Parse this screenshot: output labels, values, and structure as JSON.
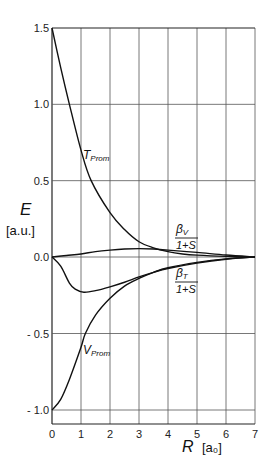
{
  "chart_data": {
    "type": "line",
    "title": "",
    "xlabel": "R [a₀]",
    "ylabel": "E [a.u.]",
    "xlim": [
      0,
      7
    ],
    "ylim": [
      -1.0,
      1.5
    ],
    "grid": true,
    "legend": "none (inline curve labels)",
    "x_ticks": [
      "0",
      "1",
      "2",
      "3",
      "4",
      "5",
      "6",
      "7"
    ],
    "y_ticks": [
      "1.5",
      "1.0",
      "0.5",
      "0.0",
      "-0.5",
      "-1.0"
    ],
    "series": [
      {
        "name": "T_Prom",
        "label_text": "T",
        "label_sub": "Prom",
        "x": [
          0,
          0.3,
          0.6,
          1.0,
          1.35,
          2.0,
          2.5,
          3.0,
          3.5,
          4.0,
          4.5,
          5.0,
          6.0,
          7.0
        ],
        "y": [
          1.5,
          1.24,
          1.0,
          0.7,
          0.5,
          0.29,
          0.18,
          0.1,
          0.06,
          0.035,
          0.02,
          0.012,
          0.004,
          0.0
        ]
      },
      {
        "name": "V_Prom",
        "label_text": "V",
        "label_sub": "Prom",
        "x": [
          0,
          0.3,
          0.6,
          1.0,
          1.15,
          1.5,
          2.0,
          2.5,
          3.0,
          3.5,
          4.0,
          5.0,
          6.0,
          7.0
        ],
        "y": [
          -1.0,
          -0.93,
          -0.8,
          -0.59,
          -0.5,
          -0.38,
          -0.27,
          -0.19,
          -0.14,
          -0.1,
          -0.07,
          -0.035,
          -0.012,
          0.0
        ]
      },
      {
        "name": "beta_V/(1+S)",
        "label_text": "β",
        "label_sub": "V",
        "label_den": "1+S",
        "x": [
          0,
          0.5,
          1.0,
          1.5,
          2.0,
          2.5,
          3.0,
          3.5,
          4.0,
          5.0,
          6.0,
          7.0
        ],
        "y": [
          0.0,
          0.01,
          0.02,
          0.035,
          0.045,
          0.052,
          0.055,
          0.052,
          0.045,
          0.03,
          0.013,
          0.0
        ]
      },
      {
        "name": "beta_T/(1+S)",
        "label_text": "β",
        "label_sub": "T",
        "label_den": "1+S",
        "x": [
          0,
          0.3,
          0.6,
          0.8,
          1.1,
          1.5,
          2.0,
          2.5,
          3.0,
          3.5,
          4.0,
          5.0,
          6.0,
          7.0
        ],
        "y": [
          0.0,
          -0.06,
          -0.17,
          -0.21,
          -0.23,
          -0.22,
          -0.195,
          -0.165,
          -0.13,
          -0.1,
          -0.075,
          -0.04,
          -0.015,
          0.0
        ]
      }
    ]
  },
  "labels": {
    "y_axis_symbol": "E",
    "y_axis_unit": "[a.u.]",
    "x_axis_symbol": "R",
    "x_axis_unit": "[a₀]",
    "fraction_denominator": "1+S"
  }
}
